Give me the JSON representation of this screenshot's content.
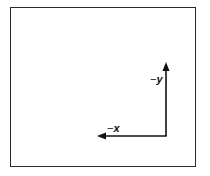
{
  "diagram": {
    "type": "axes",
    "frame": {
      "border_color": "#2a2a2a"
    },
    "axes": [
      {
        "name": "y",
        "label_sign": "−",
        "label_var": "y",
        "direction": "up"
      },
      {
        "name": "x",
        "label_sign": "−",
        "label_var": "x",
        "direction": "left"
      }
    ],
    "arrow_color": "#111111"
  }
}
